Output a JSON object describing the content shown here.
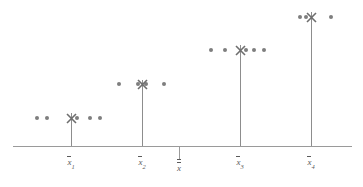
{
  "figure": {
    "title": "",
    "colors": {
      "dot": "#7e7e7e",
      "marker": "#6e6e6e",
      "stem": "#8d8d8d",
      "axis": "#9a9a9a",
      "label": "#5a5a5a",
      "background": "#ffffff"
    }
  },
  "chart_data": {
    "type": "scatter",
    "title": "",
    "xlabel": "",
    "ylabel": "",
    "grid": false,
    "legend": false,
    "axis": {
      "x_start": 13,
      "x_end": 352,
      "y": 146
    },
    "grand_mean": {
      "label_text": "x",
      "label_name": "x-double-bar",
      "overbars": 2,
      "subscript": "",
      "x": 179,
      "tick_top": 146,
      "tick_bottom": 160
    },
    "groups": [
      {
        "name": "group-1",
        "label_text": "x",
        "subscript": "1",
        "overbars": 1,
        "stem_x": 71,
        "mean_y": 118,
        "stem_top": 113,
        "stem_bottom": 146,
        "marker": {
          "x": 71,
          "y": 118,
          "glyph": "X"
        },
        "dots": [
          {
            "x": 37,
            "y": 118
          },
          {
            "x": 47,
            "y": 118
          },
          {
            "x": 77,
            "y": 118
          },
          {
            "x": 90,
            "y": 118
          },
          {
            "x": 100,
            "y": 118
          }
        ]
      },
      {
        "name": "group-2",
        "label_text": "x",
        "subscript": "2",
        "overbars": 1,
        "stem_x": 142,
        "mean_y": 84,
        "stem_top": 80,
        "stem_bottom": 146,
        "marker": {
          "x": 142,
          "y": 84,
          "glyph": "X"
        },
        "dots": [
          {
            "x": 119,
            "y": 84
          },
          {
            "x": 138,
            "y": 84
          },
          {
            "x": 146,
            "y": 84
          },
          {
            "x": 164,
            "y": 84
          }
        ]
      },
      {
        "name": "group-3",
        "label_text": "x",
        "subscript": "3",
        "overbars": 1,
        "stem_x": 240,
        "mean_y": 50,
        "stem_top": 45,
        "stem_bottom": 146,
        "marker": {
          "x": 240,
          "y": 50,
          "glyph": "X"
        },
        "dots": [
          {
            "x": 211,
            "y": 50
          },
          {
            "x": 225,
            "y": 50
          },
          {
            "x": 246,
            "y": 50
          },
          {
            "x": 254,
            "y": 50
          },
          {
            "x": 264,
            "y": 50
          }
        ]
      },
      {
        "name": "group-4",
        "label_text": "x",
        "subscript": "4",
        "overbars": 1,
        "stem_x": 311,
        "mean_y": 17,
        "stem_top": 12,
        "stem_bottom": 146,
        "marker": {
          "x": 311,
          "y": 17,
          "glyph": "X"
        },
        "dots": [
          {
            "x": 300,
            "y": 17
          },
          {
            "x": 306,
            "y": 17
          },
          {
            "x": 331,
            "y": 17
          }
        ]
      }
    ]
  }
}
